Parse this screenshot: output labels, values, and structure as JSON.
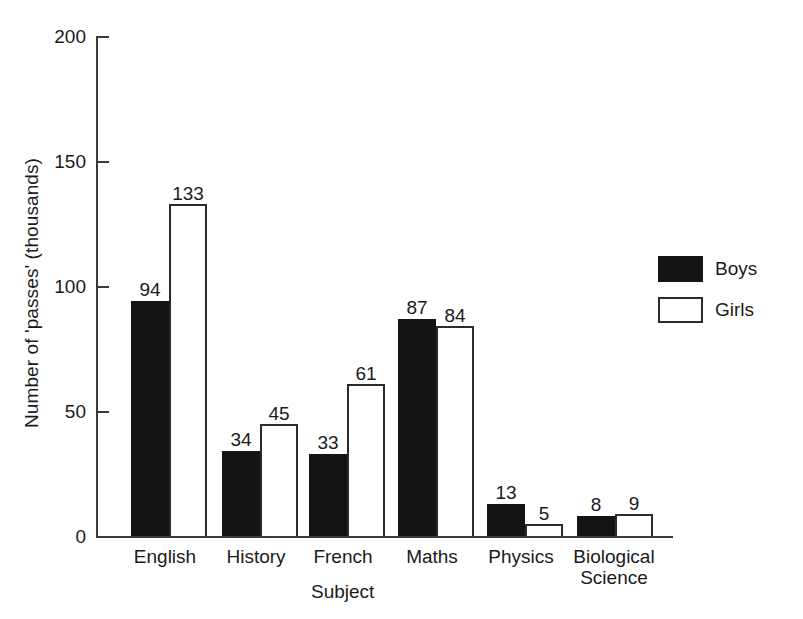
{
  "chart_data": {
    "type": "bar",
    "title": "",
    "subtitle": "",
    "xlabel": "Subject",
    "ylabel": "Number of 'passes' (thousands)",
    "categories": [
      "English",
      "History",
      "French",
      "Maths",
      "Physics",
      "Biological\nScience"
    ],
    "series": [
      {
        "name": "Boys",
        "color": "#141414",
        "values": [
          94,
          34,
          33,
          87,
          13,
          8
        ]
      },
      {
        "name": "Girls",
        "color": "#ffffff",
        "values": [
          133,
          45,
          61,
          84,
          5,
          9
        ]
      }
    ],
    "ylim": [
      0,
      200
    ],
    "yticks": [
      0,
      50,
      100,
      150,
      200
    ],
    "ytick_labels": [
      "0",
      "50",
      "100",
      "150",
      "200"
    ],
    "grid": false,
    "legend_position": "right",
    "data_labels": true,
    "bar_style": "grouped-adjacent"
  },
  "legend": {
    "items": [
      {
        "label": "Boys",
        "swatch": "filled-black"
      },
      {
        "label": "Girls",
        "swatch": "outlined-white"
      }
    ]
  }
}
